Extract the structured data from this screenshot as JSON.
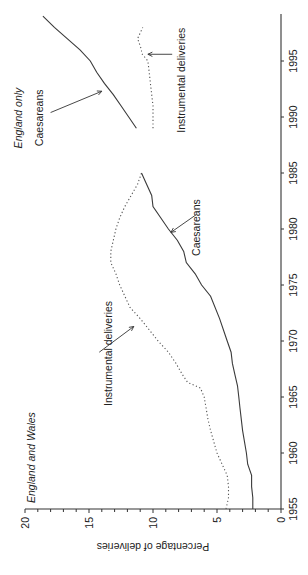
{
  "chart_data": {
    "type": "line",
    "orientation": "rotated 90 degrees counterclockwise on page",
    "title": "",
    "xlabel": "",
    "ylabel": "Percentage of deliveries",
    "xlim": [
      1955,
      1999
    ],
    "ylim": [
      0,
      20
    ],
    "x_ticks": [
      1955,
      1960,
      1965,
      1970,
      1975,
      1980,
      1985,
      1990,
      1995
    ],
    "y_ticks": [
      0,
      5,
      10,
      15,
      20
    ],
    "y_minor_tick_step": 1,
    "grid": false,
    "legend": null,
    "regions": [
      {
        "label": "England and Wales",
        "x_range": [
          1955,
          1985
        ]
      },
      {
        "label": "England only",
        "x_range": [
          1989,
          1998
        ]
      }
    ],
    "series": [
      {
        "name": "Instrumental deliveries (England and Wales)",
        "style": "dotted",
        "x": [
          1955,
          1956,
          1957,
          1958,
          1960,
          1962,
          1963,
          1965,
          1965.8,
          1966.3,
          1967,
          1968,
          1969,
          1970,
          1971,
          1972,
          1973,
          1975,
          1976,
          1977,
          1978,
          1980,
          1981,
          1982,
          1983,
          1984,
          1985
        ],
        "values": [
          4.3,
          4.1,
          4.1,
          4.2,
          5.0,
          5.5,
          5.7,
          6.0,
          6.3,
          7.3,
          7.7,
          8.2,
          8.8,
          9.6,
          10.3,
          11.0,
          11.8,
          12.6,
          12.9,
          13.3,
          13.3,
          12.9,
          12.6,
          12.2,
          11.7,
          11.2,
          10.9
        ]
      },
      {
        "name": "Caesareans (England and Wales)",
        "style": "solid",
        "x": [
          1955,
          1956,
          1957,
          1958,
          1959,
          1960,
          1962,
          1964,
          1965,
          1966,
          1967,
          1968,
          1969,
          1970,
          1972,
          1974,
          1975,
          1976,
          1977,
          1978,
          1979,
          1980,
          1981,
          1982,
          1983,
          1984,
          1985
        ],
        "values": [
          2.2,
          2.2,
          2.3,
          2.3,
          2.6,
          2.7,
          3.0,
          3.2,
          3.3,
          3.4,
          3.6,
          3.8,
          3.9,
          4.2,
          4.8,
          5.5,
          6.2,
          6.7,
          7.4,
          7.6,
          8.1,
          8.8,
          9.4,
          10.0,
          10.1,
          10.5,
          10.9
        ]
      },
      {
        "name": "Caesareans (England only)",
        "style": "solid",
        "x": [
          1989,
          1990,
          1991,
          1992,
          1993,
          1994,
          1995,
          1996,
          1997,
          1998,
          1999
        ],
        "values": [
          11.3,
          11.9,
          12.5,
          13.1,
          13.8,
          14.4,
          14.9,
          15.7,
          16.7,
          17.7,
          18.6
        ]
      },
      {
        "name": "Instrumental deliveries (England only)",
        "style": "dotted",
        "x": [
          1989,
          1990,
          1991,
          1992,
          1993,
          1994,
          1995,
          1995.7,
          1996,
          1997,
          1998
        ],
        "values": [
          10.0,
          10.0,
          10.0,
          10.1,
          10.2,
          10.3,
          10.4,
          10.9,
          10.9,
          11.2,
          10.8
        ]
      }
    ],
    "annotations": [
      {
        "text": "England and Wales",
        "style": "italic"
      },
      {
        "text": "Instrumental deliveries",
        "points_to": "Instrumental deliveries (England and Wales)",
        "at_x": 1971.5,
        "at_y": 11.0
      },
      {
        "text": "Caesareans",
        "points_to": "Caesareans (England and Wales)",
        "at_x": 1979.5,
        "at_y": 9.0
      },
      {
        "text": "England only",
        "style": "italic"
      },
      {
        "text": "Caesareans",
        "points_to": "Caesareans (England only)",
        "at_x": 1992.5,
        "at_y": 13.3
      },
      {
        "text": "Instrumental deliveries",
        "points_to": "Instrumental deliveries (England only)",
        "at_x": 1995.5,
        "at_y": 10.7
      }
    ]
  },
  "labels": {
    "ylabel": "Percentage of deliveries",
    "region_ew": "England and Wales",
    "region_eng": "England only",
    "annot_instr_ew": "Instrumental deliveries",
    "annot_caes_ew": "Caesareans",
    "annot_caes_eng": "Caesareans",
    "annot_instr_eng": "Instrumental deliveries"
  },
  "x_tick_labels": [
    "1955",
    "1960",
    "1965",
    "1970",
    "1975",
    "1980",
    "1985",
    "1990",
    "1995"
  ],
  "y_tick_labels": [
    "0",
    "5",
    "10",
    "15",
    "20"
  ]
}
